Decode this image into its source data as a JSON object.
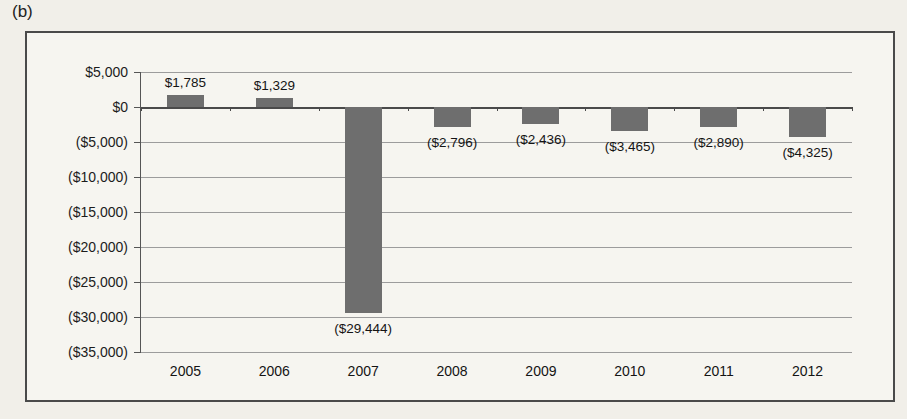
{
  "figure_label": "(b)",
  "colors": {
    "bar": "#6e6e6e",
    "grid": "#9c9c9c",
    "axis": "#4a4a4a",
    "page_background": "#f1efe9",
    "chart_background": "#f6f5f0"
  },
  "chart_data": {
    "type": "bar",
    "title": "",
    "xlabel": "",
    "ylabel": "",
    "categories": [
      "2005",
      "2006",
      "2007",
      "2008",
      "2009",
      "2010",
      "2011",
      "2012"
    ],
    "values": [
      1785,
      1329,
      -29444,
      -2796,
      -2436,
      -3465,
      -2890,
      -4325
    ],
    "bar_labels": [
      "$1,785",
      "$1,329",
      "($29,444)",
      "($2,796)",
      "($2,436)",
      "($3,465)",
      "($2,890)",
      "($4,325)"
    ],
    "ylim": [
      -35000,
      5000
    ],
    "ytick_step": 5000,
    "yticks": [
      {
        "value": 5000,
        "label": "$5,000"
      },
      {
        "value": 0,
        "label": "$0"
      },
      {
        "value": -5000,
        "label": "($5,000)"
      },
      {
        "value": -10000,
        "label": "($10,000)"
      },
      {
        "value": -15000,
        "label": "($15,000)"
      },
      {
        "value": -20000,
        "label": "($20,000)"
      },
      {
        "value": -25000,
        "label": "($25,000)"
      },
      {
        "value": -30000,
        "label": "($30,000)"
      },
      {
        "value": -35000,
        "label": "($35,000)"
      }
    ],
    "grid": true,
    "legend": false
  }
}
